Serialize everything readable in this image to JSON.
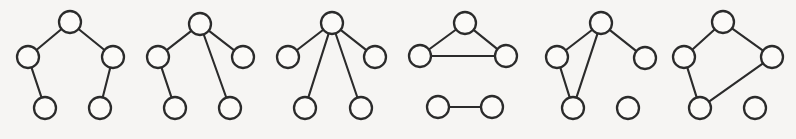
{
  "figure": {
    "background_color": "#f6f5f3",
    "node_fill_color": "#fbfaf8",
    "node_stroke_color": "#2b2b2b",
    "edge_color": "#2b2b2b",
    "node_radius": 11,
    "width": 796,
    "height": 139,
    "graph_count": 6
  },
  "graphs": [
    {
      "id": "graph-1",
      "description": "path of length four (zig-zag tree)",
      "nodes": [
        {
          "id": "g1-n1",
          "x": 70,
          "y": 22
        },
        {
          "id": "g1-n2",
          "x": 28,
          "y": 57
        },
        {
          "id": "g1-n3",
          "x": 113,
          "y": 57
        },
        {
          "id": "g1-n4",
          "x": 45,
          "y": 108
        },
        {
          "id": "g1-n5",
          "x": 100,
          "y": 108
        }
      ],
      "edges": [
        {
          "from": "g1-n1",
          "to": "g1-n2"
        },
        {
          "from": "g1-n1",
          "to": "g1-n3"
        },
        {
          "from": "g1-n2",
          "to": "g1-n4"
        },
        {
          "from": "g1-n3",
          "to": "g1-n5"
        }
      ]
    },
    {
      "id": "graph-2",
      "description": "tree with degree-three root",
      "nodes": [
        {
          "id": "g2-n1",
          "x": 200,
          "y": 24
        },
        {
          "id": "g2-n2",
          "x": 158,
          "y": 57
        },
        {
          "id": "g2-n3",
          "x": 243,
          "y": 57
        },
        {
          "id": "g2-n4",
          "x": 175,
          "y": 108
        },
        {
          "id": "g2-n5",
          "x": 230,
          "y": 108
        }
      ],
      "edges": [
        {
          "from": "g2-n1",
          "to": "g2-n2"
        },
        {
          "from": "g2-n1",
          "to": "g2-n3"
        },
        {
          "from": "g2-n1",
          "to": "g2-n5"
        },
        {
          "from": "g2-n2",
          "to": "g2-n4"
        }
      ]
    },
    {
      "id": "graph-3",
      "description": "star graph with four leaves",
      "nodes": [
        {
          "id": "g3-n1",
          "x": 332,
          "y": 23
        },
        {
          "id": "g3-n2",
          "x": 288,
          "y": 57
        },
        {
          "id": "g3-n3",
          "x": 375,
          "y": 57
        },
        {
          "id": "g3-n4",
          "x": 305,
          "y": 108
        },
        {
          "id": "g3-n5",
          "x": 361,
          "y": 108
        }
      ],
      "edges": [
        {
          "from": "g3-n1",
          "to": "g3-n2"
        },
        {
          "from": "g3-n1",
          "to": "g3-n3"
        },
        {
          "from": "g3-n1",
          "to": "g3-n4"
        },
        {
          "from": "g3-n1",
          "to": "g3-n5"
        }
      ]
    },
    {
      "id": "graph-4",
      "description": "triangle plus a disjoint edge",
      "nodes": [
        {
          "id": "g4-n1",
          "x": 465,
          "y": 23
        },
        {
          "id": "g4-n2",
          "x": 420,
          "y": 56
        },
        {
          "id": "g4-n3",
          "x": 506,
          "y": 56
        },
        {
          "id": "g4-n4",
          "x": 438,
          "y": 107
        },
        {
          "id": "g4-n5",
          "x": 492,
          "y": 107
        }
      ],
      "edges": [
        {
          "from": "g4-n1",
          "to": "g4-n2"
        },
        {
          "from": "g4-n1",
          "to": "g4-n3"
        },
        {
          "from": "g4-n2",
          "to": "g4-n3"
        },
        {
          "from": "g4-n4",
          "to": "g4-n5"
        }
      ]
    },
    {
      "id": "graph-5",
      "description": "triangle with pendant vertex plus isolated vertex",
      "nodes": [
        {
          "id": "g5-n1",
          "x": 601,
          "y": 23
        },
        {
          "id": "g5-n2",
          "x": 557,
          "y": 57
        },
        {
          "id": "g5-n3",
          "x": 645,
          "y": 58
        },
        {
          "id": "g5-n4",
          "x": 573,
          "y": 108
        },
        {
          "id": "g5-n5",
          "x": 628,
          "y": 108
        }
      ],
      "edges": [
        {
          "from": "g5-n1",
          "to": "g5-n2"
        },
        {
          "from": "g5-n1",
          "to": "g5-n3"
        },
        {
          "from": "g5-n1",
          "to": "g5-n4"
        },
        {
          "from": "g5-n2",
          "to": "g5-n4"
        }
      ]
    },
    {
      "id": "graph-6",
      "description": "four-cycle plus isolated vertex",
      "nodes": [
        {
          "id": "g6-n1",
          "x": 723,
          "y": 22
        },
        {
          "id": "g6-n2",
          "x": 684,
          "y": 57
        },
        {
          "id": "g6-n3",
          "x": 772,
          "y": 57
        },
        {
          "id": "g6-n4",
          "x": 700,
          "y": 108
        },
        {
          "id": "g6-n5",
          "x": 755,
          "y": 108
        }
      ],
      "edges": [
        {
          "from": "g6-n1",
          "to": "g6-n2"
        },
        {
          "from": "g6-n1",
          "to": "g6-n3"
        },
        {
          "from": "g6-n2",
          "to": "g6-n4"
        },
        {
          "from": "g6-n3",
          "to": "g6-n4"
        }
      ]
    }
  ]
}
